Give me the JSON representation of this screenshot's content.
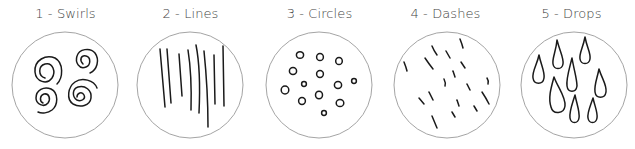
{
  "panels": [
    {
      "label": "1 - Swirls",
      "pattern": "swirls",
      "icon": "swirls-pattern-icon"
    },
    {
      "label": "2 - Lines",
      "pattern": "lines",
      "icon": "lines-pattern-icon"
    },
    {
      "label": "3 - Circles",
      "pattern": "circles",
      "icon": "circles-pattern-icon"
    },
    {
      "label": "4 - Dashes",
      "pattern": "dashes",
      "icon": "dashes-pattern-icon"
    },
    {
      "label": "5 - Drops",
      "pattern": "drops",
      "icon": "drops-pattern-icon"
    }
  ],
  "colors": {
    "ink": "#1a1a1a",
    "ring": "#9a9a9a",
    "label": "#444444",
    "background": "#ffffff"
  }
}
